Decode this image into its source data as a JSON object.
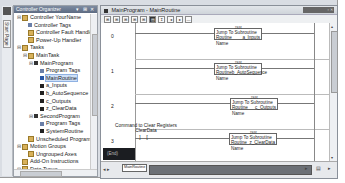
{
  "side_tab": {
    "label": "Start Page"
  },
  "organizer": {
    "title": "Controller Organizer",
    "title_controls": "▾ ⊞ ✕",
    "tree": [
      {
        "label": "Controller YourName",
        "level": 0,
        "exp": "⊟",
        "icon": "folder"
      },
      {
        "label": "Controller Tags",
        "level": 1,
        "exp": "",
        "icon": "tags"
      },
      {
        "label": "Controller Fault Handler",
        "level": 1,
        "exp": "",
        "icon": "folder"
      },
      {
        "label": "Power-Up Handler",
        "level": 1,
        "exp": "",
        "icon": "folder"
      },
      {
        "label": "Tasks",
        "level": 0,
        "exp": "⊟",
        "icon": "folder"
      },
      {
        "label": "MainTask",
        "level": 1,
        "exp": "⊟",
        "icon": "folder"
      },
      {
        "label": "MainProgram",
        "level": 2,
        "exp": "⊟",
        "icon": "prog"
      },
      {
        "label": "Program Tags",
        "level": 3,
        "exp": "",
        "icon": "tags"
      },
      {
        "label": "MainRoutine",
        "level": 3,
        "exp": "",
        "icon": "sel",
        "selected": true
      },
      {
        "label": "a_Inputs",
        "level": 3,
        "exp": "",
        "icon": "routine"
      },
      {
        "label": "b_AutoSequence",
        "level": 3,
        "exp": "",
        "icon": "routine"
      },
      {
        "label": "c_Outputs",
        "level": 3,
        "exp": "",
        "icon": "routine"
      },
      {
        "label": "z_ClearData",
        "level": 3,
        "exp": "",
        "icon": "routine"
      },
      {
        "label": "SecondProgram",
        "level": 2,
        "exp": "⊟",
        "icon": "prog"
      },
      {
        "label": "Program Tags",
        "level": 3,
        "exp": "",
        "icon": "tags"
      },
      {
        "label": "SystemRoutine",
        "level": 3,
        "exp": "",
        "icon": "routine"
      },
      {
        "label": "Unscheduled Programs",
        "level": 1,
        "exp": "",
        "icon": "folder"
      },
      {
        "label": "Motion Groups",
        "level": 0,
        "exp": "⊟",
        "icon": "folder"
      },
      {
        "label": "Ungrouped Axes",
        "level": 1,
        "exp": "",
        "icon": "folder"
      },
      {
        "label": "Add-On Instructions",
        "level": 0,
        "exp": "",
        "icon": "folder"
      },
      {
        "label": "Data Types",
        "level": 0,
        "exp": "⊟",
        "icon": "folder"
      },
      {
        "label": "User-Defined",
        "level": 1,
        "exp": "",
        "icon": "routine"
      },
      {
        "label": "Strings",
        "level": 1,
        "exp": "⊞",
        "icon": "folder"
      }
    ]
  },
  "editor": {
    "title": "MainProgram - MainRoutine",
    "window_controls": "▫ ✕",
    "toolbar": [
      "⊞",
      "⊞",
      "⊞",
      "⊞",
      "⊞",
      "▤",
      "↧",
      "◂",
      "▸",
      "—"
    ],
    "rungs": [
      {
        "number": "0",
        "instruction": "JSR",
        "line1": "Jump To Subroutine",
        "routine_label": "Routine Name",
        "routine": "a_Inputs"
      },
      {
        "number": "1",
        "instruction": "JSR",
        "line1": "Jump To Subroutine",
        "routine_label": "Routine Name",
        "routine": "b_AutoSequence"
      },
      {
        "number": "2",
        "instruction": "JSR",
        "line1": "Jump To Subroutine",
        "routine_label": "Routine Name",
        "routine": "c_Outputs"
      },
      {
        "number": "3",
        "instruction": "JSR",
        "line1": "Jump To Subroutine",
        "routine_label": "Routine Name",
        "routine": "z_ClearData",
        "contact": {
          "comment": "Command to Clear Registers",
          "tag": "ClearData",
          "symbol": "] ["
        }
      }
    ],
    "status_box": "(End)",
    "bottom": {
      "nav": "◂ ▸",
      "tab_label": "MainRoutine",
      "right_controls": "▸ ▤ ▸"
    }
  }
}
